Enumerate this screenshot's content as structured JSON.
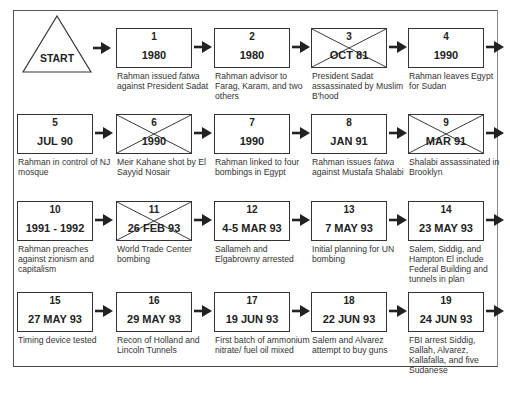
{
  "diagram": {
    "start_label": "START",
    "events": [
      {
        "num": "1",
        "date": "1980",
        "crossed": false,
        "desc_pre": "Rahman issued ",
        "desc_italic": "fatwa",
        "desc_post": " against President Sadat"
      },
      {
        "num": "2",
        "date": "1980",
        "crossed": false,
        "desc_pre": "Rahman advisor to Farag, Karam, and two others",
        "desc_italic": "",
        "desc_post": ""
      },
      {
        "num": "3",
        "date": "OCT 81",
        "crossed": true,
        "desc_pre": "President Sadat assassinated by Muslim B'hood",
        "desc_italic": "",
        "desc_post": ""
      },
      {
        "num": "4",
        "date": "1990",
        "crossed": false,
        "desc_pre": "Rahman leaves Egypt for Sudan",
        "desc_italic": "",
        "desc_post": ""
      },
      {
        "num": "5",
        "date": "JUL 90",
        "crossed": false,
        "desc_pre": "Rahman in control of NJ mosque",
        "desc_italic": "",
        "desc_post": ""
      },
      {
        "num": "6",
        "date": "1990",
        "crossed": true,
        "desc_pre": "Meir Kahane shot by El Sayyid Nosair",
        "desc_italic": "",
        "desc_post": ""
      },
      {
        "num": "7",
        "date": "1990",
        "crossed": false,
        "desc_pre": "Rahman linked to four bombings in Egypt",
        "desc_italic": "",
        "desc_post": ""
      },
      {
        "num": "8",
        "date": "JAN 91",
        "crossed": false,
        "desc_pre": "Rahman issues ",
        "desc_italic": "fatwa",
        "desc_post": " against Mustafa Shalabi"
      },
      {
        "num": "9",
        "date": "MAR 91",
        "crossed": true,
        "desc_pre": "Shalabi assassinated in Brooklyn",
        "desc_italic": "",
        "desc_post": ""
      },
      {
        "num": "10",
        "date": "1991 - 1992",
        "crossed": false,
        "desc_pre": "Rahman preaches against zionism and capitalism",
        "desc_italic": "",
        "desc_post": ""
      },
      {
        "num": "11",
        "date": "26 FEB 93",
        "crossed": true,
        "desc_pre": "World Trade Center bombing",
        "desc_italic": "",
        "desc_post": ""
      },
      {
        "num": "12",
        "date": "4-5 MAR 93",
        "crossed": false,
        "desc_pre": "Sallameh and Elgabrowny arrested",
        "desc_italic": "",
        "desc_post": ""
      },
      {
        "num": "13",
        "date": "7 MAY 93",
        "crossed": false,
        "desc_pre": "Initial planning for UN bombing",
        "desc_italic": "",
        "desc_post": ""
      },
      {
        "num": "14",
        "date": "23 MAY 93",
        "crossed": false,
        "desc_pre": "Salem, Siddig, and Hampton El include Federal Building and tunnels in plan",
        "desc_italic": "",
        "desc_post": ""
      },
      {
        "num": "15",
        "date": "27 MAY 93",
        "crossed": false,
        "desc_pre": "Timing device tested",
        "desc_italic": "",
        "desc_post": ""
      },
      {
        "num": "16",
        "date": "29 MAY 93",
        "crossed": false,
        "desc_pre": "Recon of Holland and Lincoln Tunnels",
        "desc_italic": "",
        "desc_post": ""
      },
      {
        "num": "17",
        "date": "19 JUN 93",
        "crossed": false,
        "desc_pre": "First batch of ammonium nitrate/ fuel oil mixed",
        "desc_italic": "",
        "desc_post": ""
      },
      {
        "num": "18",
        "date": "22 JUN 93",
        "crossed": false,
        "desc_pre": "Salem and Alvarez attempt to buy guns",
        "desc_italic": "",
        "desc_post": ""
      },
      {
        "num": "19",
        "date": "24 JUN 93",
        "crossed": false,
        "desc_pre": "FBI arrest Siddig, Sallah, Alvarez, Kallafalla, and five Sudanese",
        "desc_italic": "",
        "desc_post": ""
      }
    ]
  }
}
